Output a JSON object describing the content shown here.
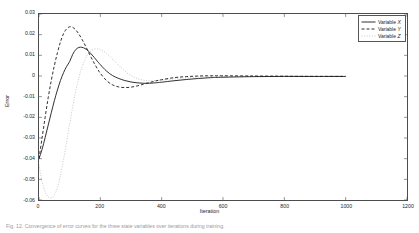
{
  "figure": {
    "background": "#ffffff",
    "axis_color": "#4d4d4d",
    "text_color": "#262626"
  },
  "axes": {
    "xlabel": "Iteration",
    "ylabel": "Error",
    "xticks": [
      "0",
      "200",
      "400",
      "600",
      "800",
      "1000",
      "1200"
    ],
    "yticks": [
      "0.03",
      "0.02",
      "0.01",
      "0",
      "-0.01",
      "-0.02",
      "-0.03",
      "-0.04",
      "-0.05",
      "-0.06"
    ]
  },
  "legend": {
    "position": "top-right",
    "items": [
      {
        "label_prefix": "Variable ",
        "label_var": "X",
        "style": "solid",
        "color": "#1a1a1a"
      },
      {
        "label_prefix": "Variable ",
        "label_var": "Y",
        "style": "dashed",
        "color": "#1a1a1a"
      },
      {
        "label_prefix": "Variable ",
        "label_var": "Z",
        "style": "dotted",
        "color": "#c8c8c8"
      }
    ]
  },
  "caption": {
    "text": "Fig. 12.  Convergence of error curves for the three state variables over iterations during training."
  },
  "chart_data": {
    "type": "line",
    "title": "",
    "xlabel": "Iteration",
    "ylabel": "Error",
    "xlim": [
      0,
      1200
    ],
    "ylim": [
      -0.06,
      0.03
    ],
    "grid": false,
    "legend_position": "top-right",
    "x": [
      0,
      10,
      20,
      30,
      40,
      50,
      60,
      70,
      80,
      90,
      100,
      110,
      120,
      130,
      140,
      150,
      160,
      170,
      180,
      190,
      200,
      220,
      240,
      260,
      280,
      300,
      320,
      340,
      360,
      380,
      400,
      440,
      480,
      520,
      560,
      600,
      700,
      800,
      900,
      1000
    ],
    "series": [
      {
        "name": "Variable X",
        "style": "solid",
        "color": "#1a1a1a",
        "values": [
          -0.04,
          -0.0355,
          -0.0298,
          -0.0238,
          -0.0178,
          -0.012,
          -0.0068,
          -0.0022,
          0.0016,
          0.0046,
          0.007,
          0.0105,
          0.0128,
          0.0138,
          0.0139,
          0.0133,
          0.0122,
          0.0107,
          0.009,
          0.0072,
          0.0055,
          0.0024,
          0.0002,
          -0.0012,
          -0.0022,
          -0.0029,
          -0.0033,
          -0.0035,
          -0.0035,
          -0.0033,
          -0.003,
          -0.0023,
          -0.0017,
          -0.0012,
          -0.0008,
          -0.0006,
          -0.0003,
          -0.0002,
          -0.0002,
          -0.0002
        ]
      },
      {
        "name": "Variable Y",
        "style": "dashed",
        "color": "#1a1a1a",
        "values": [
          -0.04,
          -0.03,
          -0.02,
          -0.0105,
          -0.0022,
          0.005,
          0.0112,
          0.0165,
          0.0205,
          0.0228,
          0.0238,
          0.0235,
          0.0223,
          0.0203,
          0.0178,
          0.015,
          0.012,
          0.009,
          0.0062,
          0.0036,
          0.0013,
          -0.0022,
          -0.0043,
          -0.0053,
          -0.0056,
          -0.0054,
          -0.0048,
          -0.004,
          -0.0032,
          -0.0024,
          -0.0018,
          -0.0008,
          -0.0003,
          0.0,
          0.0001,
          0.0001,
          0.0,
          -0.0001,
          -0.0002,
          -0.0002
        ]
      },
      {
        "name": "Variable Z",
        "style": "dotted",
        "color": "#c8c8c8",
        "values": [
          -0.043,
          -0.051,
          -0.056,
          -0.0585,
          -0.059,
          -0.0575,
          -0.054,
          -0.048,
          -0.0405,
          -0.032,
          -0.0232,
          -0.0148,
          -0.0072,
          -0.0008,
          0.0042,
          0.008,
          0.0106,
          0.0122,
          0.013,
          0.0131,
          0.0128,
          0.011,
          0.0082,
          0.0052,
          0.0024,
          0.0002,
          -0.0012,
          -0.002,
          -0.0023,
          -0.0022,
          -0.002,
          -0.0014,
          -0.0009,
          -0.0005,
          -0.0003,
          -0.0002,
          -0.0002,
          -0.0002,
          -0.0002,
          -0.0002
        ]
      }
    ]
  }
}
